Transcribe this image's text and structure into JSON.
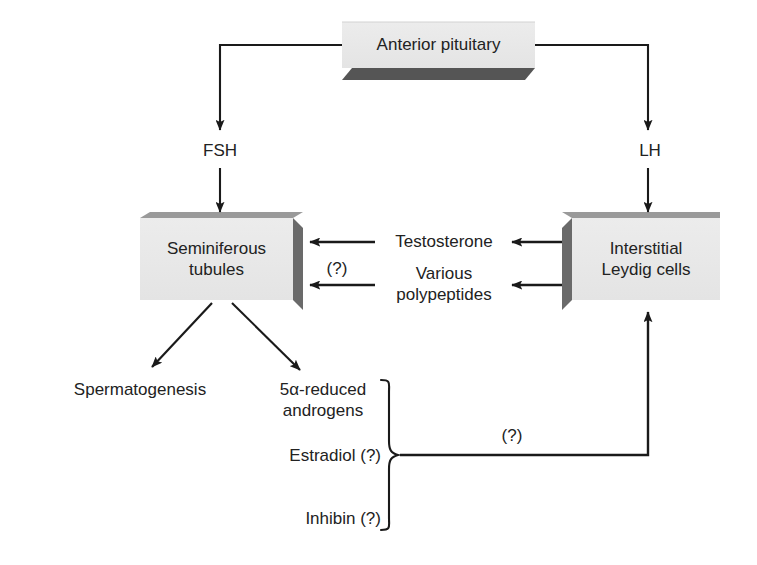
{
  "diagram": {
    "background_color": "#ffffff",
    "line_color": "#1a1a1a",
    "box_face_color": "#e8e8e8",
    "box_shadow_color": "#5a5a5a",
    "nodes": {
      "pituitary": {
        "label": "Anterior pituitary",
        "x": 342,
        "y": 22,
        "width": 193,
        "height": 46
      },
      "seminiferous": {
        "line1": "Seminiferous",
        "line2": "tubules",
        "x": 140,
        "y": 218,
        "width": 153,
        "height": 82
      },
      "leydig": {
        "line1": "Interstitial",
        "line2": "Leydig cells",
        "x": 572,
        "y": 218,
        "width": 148,
        "height": 82
      }
    },
    "hormones": {
      "fsh": "FSH",
      "lh": "LH",
      "testosterone": "Testosterone",
      "polypeptides_line1": "Various",
      "polypeptides_line2": "polypeptides"
    },
    "outputs": {
      "spermatogenesis": "Spermatogenesis",
      "androgens_line1": "5α-reduced",
      "androgens_line2": "androgens",
      "estradiol": "Estradiol (?)",
      "inhibin": "Inhibin (?)"
    },
    "annotations": {
      "unknown_tubule_feedback": "(?)",
      "unknown_leydig_feedback": "(?)"
    }
  }
}
